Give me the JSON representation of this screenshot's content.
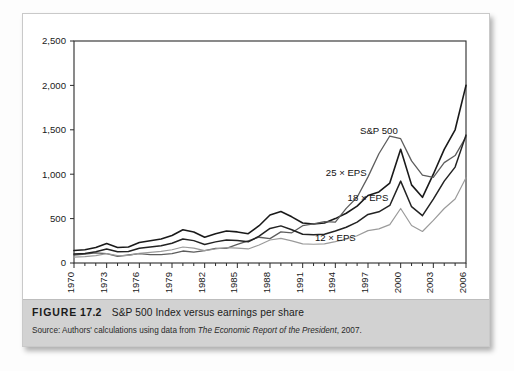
{
  "figure": {
    "label_word": "FIGURE",
    "number": "17.2",
    "title": "S&P 500 Index versus earnings per share",
    "source_prefix": "Source: Authors' calculations using data from ",
    "source_italic": "The Economic Report of the President",
    "source_suffix": ", 2007."
  },
  "chart_data": {
    "type": "line",
    "title": "S&P 500 Index versus earnings per share",
    "xlabel": "",
    "ylabel": "",
    "grid": false,
    "legend_position": "inline-annotations",
    "xlim": [
      1970,
      2006
    ],
    "ylim": [
      0,
      2500
    ],
    "ytick_values": [
      0,
      500,
      1000,
      1500,
      2000,
      2500
    ],
    "ytick_labels": [
      "0",
      "500",
      "1,000",
      "1,500",
      "2,000",
      "2,500"
    ],
    "xtick_labels": [
      "1970",
      "1973",
      "1976",
      "1979",
      "1982",
      "1985",
      "1988",
      "1991",
      "1994",
      "1997",
      "2000",
      "2003",
      "2006"
    ],
    "xtick_values": [
      1970,
      1973,
      1976,
      1979,
      1982,
      1985,
      1988,
      1991,
      1994,
      1997,
      2000,
      2003,
      2006
    ],
    "x": [
      1970,
      1971,
      1972,
      1973,
      1974,
      1975,
      1976,
      1977,
      1978,
      1979,
      1980,
      1981,
      1982,
      1983,
      1984,
      1985,
      1986,
      1987,
      1988,
      1989,
      1990,
      1991,
      1992,
      1993,
      1994,
      1995,
      1996,
      1997,
      1998,
      1999,
      2000,
      2001,
      2002,
      2003,
      2004,
      2005,
      2006
    ],
    "series": [
      {
        "name": "25 × EPS",
        "color": "#1a1a1a",
        "width": 1.6,
        "values": [
          140,
          150,
          175,
          220,
          175,
          180,
          230,
          250,
          270,
          310,
          375,
          350,
          290,
          330,
          360,
          350,
          330,
          420,
          540,
          580,
          520,
          450,
          440,
          450,
          500,
          560,
          640,
          760,
          800,
          900,
          1280,
          880,
          740,
          1000,
          1280,
          1500,
          2000
        ],
        "label_x": 1995,
        "label_y": 980
      },
      {
        "name": "S&P 500",
        "color": "#5d5d5d",
        "width": 1.3,
        "values": [
          90,
          100,
          115,
          105,
          75,
          90,
          105,
          95,
          95,
          105,
          135,
          123,
          140,
          165,
          165,
          210,
          250,
          290,
          275,
          350,
          340,
          420,
          440,
          465,
          460,
          615,
          740,
          970,
          1230,
          1430,
          1400,
          1150,
          990,
          965,
          1130,
          1210,
          1420
        ],
        "label_x": 1998,
        "label_y": 1450
      },
      {
        "name": "18 × EPS",
        "color": "#232323",
        "width": 1.5,
        "values": [
          100,
          108,
          126,
          158,
          126,
          130,
          166,
          180,
          194,
          223,
          270,
          252,
          209,
          238,
          259,
          252,
          238,
          302,
          389,
          418,
          374,
          324,
          317,
          324,
          360,
          403,
          461,
          547,
          576,
          648,
          922,
          634,
          533,
          720,
          922,
          1080,
          1440
        ],
        "label_x": 1997,
        "label_y": 700
      },
      {
        "name": "12 × EPS",
        "color": "#9b9b9b",
        "width": 1.2,
        "values": [
          67,
          72,
          84,
          106,
          84,
          86,
          110,
          120,
          130,
          149,
          180,
          168,
          139,
          158,
          173,
          168,
          158,
          202,
          259,
          278,
          250,
          216,
          211,
          216,
          240,
          269,
          307,
          365,
          384,
          432,
          614,
          422,
          355,
          480,
          614,
          720,
          960
        ],
        "label_x": 1994,
        "label_y": 250
      }
    ]
  }
}
